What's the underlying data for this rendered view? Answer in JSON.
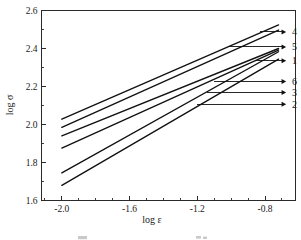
{
  "chart_data": {
    "type": "line",
    "title": "",
    "subtitle": "",
    "xlabel": "log ε",
    "ylabel": "log σ",
    "xlim": [
      -2.12,
      -0.62
    ],
    "ylim": [
      1.6,
      2.6
    ],
    "grid": false,
    "legend_position": "inline-right-arrows",
    "x_ticks": [
      -2.0,
      -1.6,
      -1.2,
      -0.8
    ],
    "x_tick_labels": [
      "-2.0",
      "-1.6",
      "-1.2",
      "-0.8"
    ],
    "x_minor_ticks": [
      -2.1,
      -1.9,
      -1.8,
      -1.7,
      -1.5,
      -1.4,
      -1.3,
      -1.1,
      -1.0,
      -0.9,
      -0.7
    ],
    "y_ticks": [
      1.6,
      1.8,
      2.0,
      2.2,
      2.4,
      2.6
    ],
    "y_tick_labels": [
      "1.6",
      "1.8",
      "2.0",
      "2.2",
      "2.4",
      "2.6"
    ],
    "y_minor_ticks": [
      1.7,
      1.9,
      2.1,
      2.3,
      2.5
    ],
    "series": [
      {
        "name": "4",
        "label": "4",
        "x": [
          -2.0,
          -0.72
        ],
        "values": [
          2.028,
          2.524
        ],
        "slope": 0.388,
        "label_x": -0.64,
        "label_y": 2.487
      },
      {
        "name": "5",
        "label": "5",
        "x": [
          -2.0,
          -0.72
        ],
        "values": [
          1.985,
          2.497
        ],
        "slope": 0.4,
        "label_x": -0.64,
        "label_y": 2.408
      },
      {
        "name": "1",
        "label": "1",
        "x": [
          -2.0,
          -0.72
        ],
        "values": [
          1.94,
          2.4
        ],
        "slope": 0.359,
        "label_x": -0.64,
        "label_y": 2.336
      },
      {
        "name": "6",
        "label": "6",
        "x": [
          -2.0,
          -0.72
        ],
        "values": [
          1.876,
          2.392
        ],
        "slope": 0.403,
        "label_x": -0.64,
        "label_y": 2.226
      },
      {
        "name": "3",
        "label": "3",
        "x": [
          -2.0,
          -0.72
        ],
        "values": [
          1.745,
          2.383
        ],
        "slope": 0.498,
        "label_x": -0.64,
        "label_y": 2.169
      },
      {
        "name": "2",
        "label": "2",
        "x": [
          -2.0,
          -0.72
        ],
        "values": [
          1.68,
          2.344
        ],
        "slope": 0.519,
        "label_x": -0.64,
        "label_y": 2.106
      }
    ],
    "leaders": [
      {
        "name": "4",
        "from_x": -0.83,
        "from_y": 2.487,
        "to_x": -0.675,
        "to_y": 2.487
      },
      {
        "name": "5",
        "from_x": -1.02,
        "from_y": 2.408,
        "to_x": -0.675,
        "to_y": 2.408
      },
      {
        "name": "1",
        "from_x": -0.86,
        "from_y": 2.336,
        "to_x": -0.675,
        "to_y": 2.336
      },
      {
        "name": "6",
        "from_x": -1.1,
        "from_y": 2.226,
        "to_x": -0.675,
        "to_y": 2.226
      },
      {
        "name": "3",
        "from_x": -1.14,
        "from_y": 2.169,
        "to_x": -0.675,
        "to_y": 2.169
      },
      {
        "name": "2",
        "from_x": -1.2,
        "from_y": 2.106,
        "to_x": -0.675,
        "to_y": 2.106
      }
    ]
  },
  "figure": {
    "axis_color": "#2a2a2a",
    "line_color": "#111111",
    "background": "#ffffff"
  }
}
